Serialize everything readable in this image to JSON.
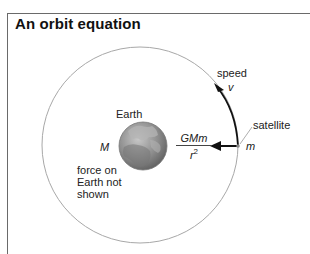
{
  "title": "An orbit equation",
  "labels": {
    "earth": "Earth",
    "earth_mass": "M",
    "force_note": [
      "force on",
      "Earth not",
      "shown"
    ],
    "speed": "speed",
    "velocity_symbol": "v",
    "satellite": "satellite",
    "satellite_mass": "m"
  },
  "force": {
    "numerator": "GMm",
    "denominator_var": "r",
    "denominator_exp": "2"
  },
  "colors": {
    "frame": "#6a6a6a",
    "orbit": "#a8a8a8",
    "arrow": "#111111",
    "earth_land": "#8a8a8a",
    "earth_ocean": "#6e6e6e"
  }
}
